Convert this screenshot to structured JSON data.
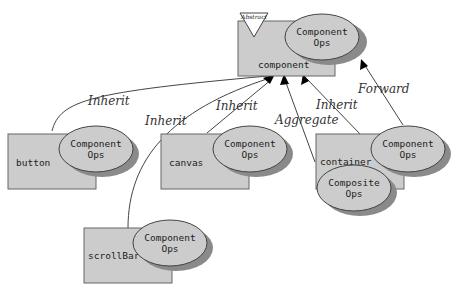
{
  "diagram": {
    "nodes": {
      "component": {
        "name": "component",
        "badge": "Abstract",
        "ops": [
          "Component",
          "Ops"
        ]
      },
      "button": {
        "name": "button",
        "ops": [
          "Component",
          "Ops"
        ]
      },
      "canvas": {
        "name": "canvas",
        "ops": [
          "Component",
          "Ops"
        ]
      },
      "container": {
        "name": "container",
        "ops": [
          "Component",
          "Ops"
        ],
        "ops2": [
          "Composite",
          "Ops"
        ]
      },
      "scrollBar": {
        "name": "scrollBar",
        "ops": [
          "Component",
          "Ops"
        ]
      }
    },
    "edges": [
      {
        "from": "button",
        "to": "component",
        "label": "Inherit"
      },
      {
        "from": "scrollBar",
        "to": "component",
        "label": "Inherit"
      },
      {
        "from": "canvas",
        "to": "component",
        "label": "Inherit"
      },
      {
        "from": "container",
        "to": "component",
        "label": "Aggregate"
      },
      {
        "from": "container",
        "to": "component",
        "label": "Inherit"
      },
      {
        "from": "container-ops",
        "to": "component-ops",
        "label": "Forward"
      }
    ]
  }
}
